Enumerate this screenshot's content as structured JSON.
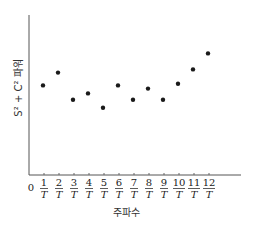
{
  "chart_data": {
    "type": "scatter",
    "title": "",
    "xlabel": "주파수",
    "ylabel": "S² + C² 파워",
    "origin_label": "0",
    "x": [
      1,
      2,
      3,
      4,
      5,
      6,
      7,
      8,
      9,
      10,
      11,
      12
    ],
    "tick_labels": [
      {
        "num": "1",
        "den": "T"
      },
      {
        "num": "2",
        "den": "T"
      },
      {
        "num": "3",
        "den": "T"
      },
      {
        "num": "4",
        "den": "T"
      },
      {
        "num": "5",
        "den": "T"
      },
      {
        "num": "6",
        "den": "T"
      },
      {
        "num": "7",
        "den": "T"
      },
      {
        "num": "8",
        "den": "T"
      },
      {
        "num": "9",
        "den": "T"
      },
      {
        "num": "10",
        "den": "T"
      },
      {
        "num": "11",
        "den": "T"
      },
      {
        "num": "12",
        "den": "T"
      }
    ],
    "values": [
      5.6,
      6.4,
      4.7,
      5.1,
      4.2,
      5.6,
      4.7,
      5.4,
      4.7,
      5.7,
      6.6,
      7.6
    ],
    "y_units": "relative (no scale shown)",
    "xlim": [
      0,
      14.5
    ],
    "ylim": [
      0,
      10
    ],
    "grid": false,
    "legend": "none"
  }
}
